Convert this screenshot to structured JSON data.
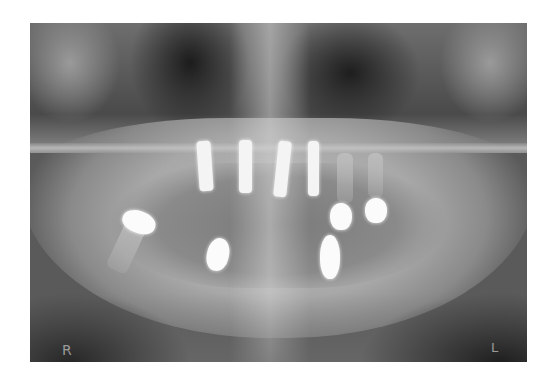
{
  "image": {
    "kind": "dental panoramic radiograph",
    "description": "Panoramic X-ray of edentulous jaws with four upper anterior implants, two upper left crowned teeth, one lower right molar crown, and two lower anterior implant heads",
    "border_color": "#ffffff"
  },
  "labels": {
    "right_marker": "R",
    "left_marker": "L"
  },
  "objects": {
    "upper_implants": 4,
    "upper_crowns": 2,
    "lower_molar_crown": 1,
    "lower_implant_heads": 2
  }
}
